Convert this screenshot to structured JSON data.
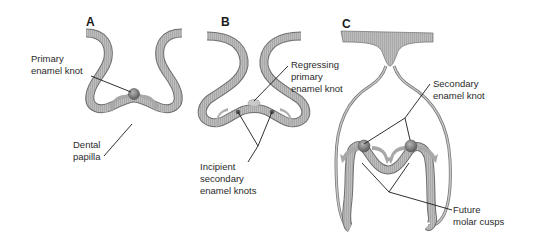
{
  "panels": [
    {
      "id": "A",
      "label": "A"
    },
    {
      "id": "B",
      "label": "B"
    },
    {
      "id": "C",
      "label": "C"
    }
  ],
  "labels": {
    "a_primary_knot": [
      "Primary",
      "enamel knot"
    ],
    "a_dental_papilla": [
      "Dental",
      "papilla"
    ],
    "b_regressing": [
      "Regressing",
      "primary",
      "enamel knot"
    ],
    "b_incipient": [
      "Incipient",
      "secondary",
      "enamel knots"
    ],
    "c_secondary": [
      "Secondary",
      "enamel knot"
    ],
    "c_future_cusps": [
      "Future",
      "molar cusps"
    ]
  },
  "colors": {
    "epithelium_fill": "#b8b8b8",
    "epithelium_stroke": "#6e6e6e",
    "knot_fill": "#7d7d7d",
    "arrow_fill": "#a8a8a8",
    "leader_line": "#1a1a1a"
  }
}
